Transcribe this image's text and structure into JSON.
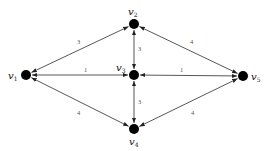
{
  "graph": {
    "type": "weighted bidirectional graph",
    "colors": {
      "node": "#000000",
      "edge": "#444444",
      "weight_text": "#555555",
      "background": "#ffffff"
    },
    "nodes": [
      {
        "id": "v1",
        "name": "v",
        "sub": "1",
        "x": 26,
        "y": 75,
        "lx": 8,
        "ly": 79
      },
      {
        "id": "v2",
        "name": "v",
        "sub": "2",
        "x": 134,
        "y": 24,
        "lx": 128,
        "ly": 15
      },
      {
        "id": "v3",
        "name": "v",
        "sub": "3",
        "x": 134,
        "y": 75,
        "lx": 116,
        "ly": 71
      },
      {
        "id": "v4",
        "name": "v",
        "sub": "4",
        "x": 134,
        "y": 129,
        "lx": 129,
        "ly": 145
      },
      {
        "id": "v5",
        "name": "v",
        "sub": "5",
        "x": 243,
        "y": 76,
        "lx": 251,
        "ly": 80
      }
    ],
    "edges": [
      {
        "from": "v1",
        "to": "v2",
        "weight": "3",
        "wx": 77,
        "wy": 44
      },
      {
        "from": "v2",
        "to": "v3",
        "weight": "3",
        "wx": 138,
        "wy": 51
      },
      {
        "from": "v2",
        "to": "v5",
        "weight": "4",
        "wx": 190,
        "wy": 44
      },
      {
        "from": "v1",
        "to": "v3",
        "weight": "1",
        "wx": 84,
        "wy": 72
      },
      {
        "from": "v3",
        "to": "v5",
        "weight": "1",
        "wx": 180,
        "wy": 72
      },
      {
        "from": "v3",
        "to": "v4",
        "weight": "3",
        "wx": 138,
        "wy": 104
      },
      {
        "from": "v1",
        "to": "v4",
        "weight": "4",
        "wx": 77,
        "wy": 115
      },
      {
        "from": "v4",
        "to": "v5",
        "weight": "4",
        "wx": 191,
        "wy": 115
      }
    ]
  }
}
